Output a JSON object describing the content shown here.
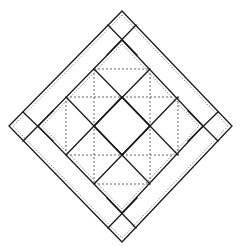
{
  "diagram": {
    "type": "quilt-block",
    "colors": {
      "background": "#ffffff",
      "solid_line": "#1a1a1a",
      "dashed_line": "#555555"
    },
    "outer_diamond": {
      "top": [
        122,
        11
      ],
      "right": [
        232,
        126
      ],
      "bottom": [
        122,
        242
      ],
      "left": [
        9,
        126
      ]
    },
    "inner_diamond": {
      "top": [
        122,
        40
      ],
      "right": [
        203,
        126
      ],
      "bottom": [
        122,
        213
      ],
      "left": [
        38,
        126
      ]
    },
    "dashed_grid": {
      "vertical": [
        {
          "x": 66,
          "y1": 97,
          "y2": 155
        },
        {
          "x": 94,
          "y1": 69,
          "y2": 184
        },
        {
          "x": 150,
          "y1": 69,
          "y2": 184
        },
        {
          "x": 178,
          "y1": 97,
          "y2": 155
        }
      ],
      "horizontal": [
        {
          "y": 69,
          "x1": 94,
          "x2": 150
        },
        {
          "y": 97,
          "x1": 66,
          "x2": 178
        },
        {
          "y": 155,
          "x1": 66,
          "x2": 178
        },
        {
          "y": 184,
          "x1": 94,
          "x2": 150
        }
      ]
    }
  }
}
